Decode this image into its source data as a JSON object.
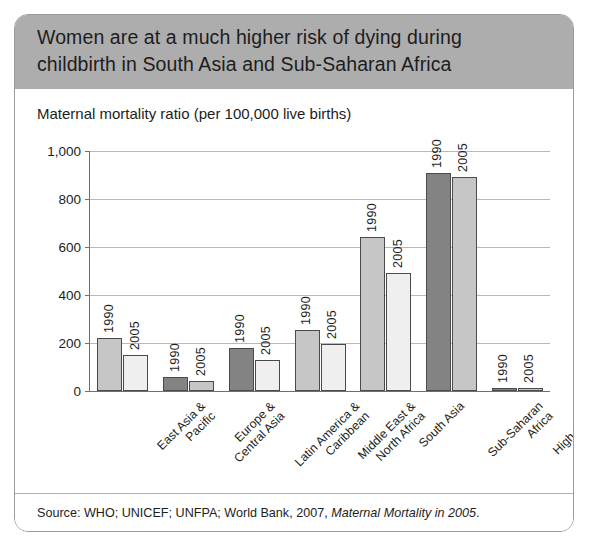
{
  "header": {
    "title_line1": "Women are at a much higher risk of dying during",
    "title_line2": "childbirth in South Asia and Sub-Saharan Africa",
    "band_color": "#adadad"
  },
  "subtitle": "Maternal mortality ratio (per 100,000 live births)",
  "source": {
    "prefix": "Source: WHO; UNICEF; UNFPA; World Bank, 2007, ",
    "italic": "Maternal Mortality in 2005",
    "suffix": "."
  },
  "chart_data": {
    "type": "bar",
    "title": "Women are at a much higher risk of dying during childbirth in South Asia and Sub-Saharan Africa",
    "subtitle": "Maternal mortality ratio (per 100,000 live births)",
    "xlabel": "",
    "ylabel": "Maternal mortality ratio (per 100,000 live births)",
    "ylim": [
      0,
      1000
    ],
    "yticks": [
      0,
      200,
      400,
      600,
      800,
      1000
    ],
    "ytick_labels": [
      "0",
      "200",
      "400",
      "600",
      "800",
      "1,000"
    ],
    "grid": true,
    "legend": "none",
    "series_labels": [
      "1990",
      "2005"
    ],
    "categories": [
      "East Asia &\nPacific",
      "Europe &\nCentral Asia",
      "Latin America &\nCaribbean",
      "Middle East &\nNorth Africa",
      "South Asia",
      "Sub-Saharan\nAfrica",
      "High-income"
    ],
    "series": [
      {
        "name": "1990",
        "values": [
          220,
          58,
          180,
          255,
          640,
          910,
          10
        ]
      },
      {
        "name": "2005",
        "values": [
          150,
          42,
          130,
          195,
          490,
          890,
          8
        ]
      }
    ]
  },
  "bars": [
    {
      "cat_line1": "East Asia &",
      "cat_line2": "Pacific",
      "v1990": 220,
      "v2005": 150,
      "shade1990": "mid",
      "shade2005": "light"
    },
    {
      "cat_line1": "Europe &",
      "cat_line2": "Central Asia",
      "v1990": 58,
      "v2005": 42,
      "shade1990": "dark",
      "shade2005": "mid"
    },
    {
      "cat_line1": "Latin America &",
      "cat_line2": "Caribbean",
      "v1990": 180,
      "v2005": 130,
      "shade1990": "dark",
      "shade2005": "light"
    },
    {
      "cat_line1": "Middle East &",
      "cat_line2": "North Africa",
      "v1990": 255,
      "v2005": 195,
      "shade1990": "mid",
      "shade2005": "light"
    },
    {
      "cat_line1": "South Asia",
      "cat_line2": "",
      "v1990": 640,
      "v2005": 490,
      "shade1990": "mid",
      "shade2005": "light"
    },
    {
      "cat_line1": "Sub-Saharan",
      "cat_line2": "Africa",
      "v1990": 910,
      "v2005": 890,
      "shade1990": "dark",
      "shade2005": "mid"
    },
    {
      "cat_line1": "High-income",
      "cat_line2": "",
      "v1990": 10,
      "v2005": 8,
      "shade1990": "dark",
      "shade2005": "mid"
    }
  ]
}
